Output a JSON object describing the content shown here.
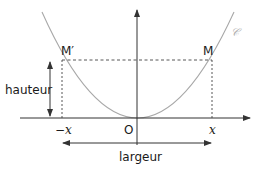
{
  "diagram": {
    "title_fragment": "",
    "curve": {
      "label": "𝒞",
      "type": "parabola",
      "color": "#a8a8a8"
    },
    "axes": {
      "origin_label": "O",
      "x_positive_label": "x",
      "x_negative_label": "−x",
      "color": "#333333"
    },
    "points": {
      "m_prime": "M′",
      "m": "M"
    },
    "dimensions": {
      "height_label": "hauteur",
      "width_label": "largeur"
    }
  }
}
